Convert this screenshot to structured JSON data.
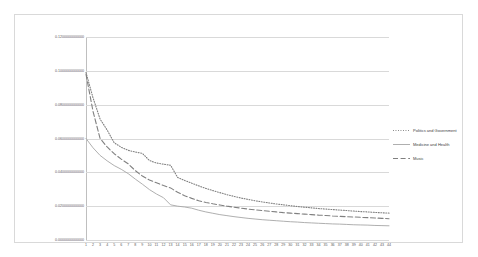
{
  "chart_data": {
    "type": "line",
    "title": "",
    "subtitle": "",
    "xlabel": "",
    "ylabel": "",
    "xlim": [
      1,
      44
    ],
    "ylim": [
      0.0,
      0.12
    ],
    "grid": true,
    "legend_position": "right",
    "y_ticks": [
      "0.0000000000000",
      "0.0200000000000",
      "0.0400000000000",
      "0.0600000000000",
      "0.0800000000000",
      "0.1000000000000",
      "0.1200000000000"
    ],
    "y_tick_values": [
      0.0,
      0.02,
      0.04,
      0.06,
      0.08,
      0.1,
      0.12
    ],
    "categories": [
      "1",
      "2",
      "3",
      "4",
      "5",
      "6",
      "7",
      "8",
      "9",
      "10",
      "11",
      "12",
      "13",
      "14",
      "15",
      "16",
      "17",
      "18",
      "19",
      "20",
      "21",
      "22",
      "23",
      "24",
      "25",
      "26",
      "27",
      "28",
      "29",
      "30",
      "31",
      "32",
      "33",
      "34",
      "35",
      "36",
      "37",
      "38",
      "39",
      "40",
      "41",
      "42",
      "43",
      "44"
    ],
    "series": [
      {
        "name": "Politics and Government",
        "style": "dotted",
        "color": "#808080",
        "values": [
          0.099,
          0.084,
          0.0715,
          0.065,
          0.0575,
          0.0548,
          0.053,
          0.052,
          0.0512,
          0.047,
          0.0455,
          0.0448,
          0.0442,
          0.037,
          0.0352,
          0.0336,
          0.032,
          0.0305,
          0.0292,
          0.028,
          0.0268,
          0.0258,
          0.0248,
          0.024,
          0.0232,
          0.0225,
          0.0219,
          0.0213,
          0.0208,
          0.0203,
          0.0198,
          0.0194,
          0.019,
          0.0186,
          0.0183,
          0.018,
          0.0177,
          0.0174,
          0.0171,
          0.0168,
          0.0166,
          0.0163,
          0.0161,
          0.0159
        ]
      },
      {
        "name": "Medicine and Health",
        "style": "solid",
        "color": "#a6a6a6",
        "values": [
          0.06,
          0.0545,
          0.05,
          0.0468,
          0.044,
          0.0418,
          0.0392,
          0.036,
          0.033,
          0.0298,
          0.0272,
          0.025,
          0.0208,
          0.02,
          0.0195,
          0.0188,
          0.0176,
          0.0166,
          0.0158,
          0.015,
          0.0144,
          0.0138,
          0.0133,
          0.0128,
          0.0124,
          0.012,
          0.0117,
          0.0114,
          0.0111,
          0.0108,
          0.0106,
          0.0103,
          0.0101,
          0.0099,
          0.0097,
          0.0095,
          0.0094,
          0.0092,
          0.009,
          0.0089,
          0.0088,
          0.0086,
          0.0085,
          0.0084
        ]
      },
      {
        "name": "Music",
        "style": "dashed",
        "color": "#808080",
        "values": [
          0.098,
          0.076,
          0.06,
          0.055,
          0.051,
          0.0478,
          0.045,
          0.041,
          0.0378,
          0.0355,
          0.0338,
          0.0322,
          0.0308,
          0.0282,
          0.0262,
          0.0246,
          0.0232,
          0.0222,
          0.0214,
          0.0207,
          0.02,
          0.0194,
          0.0188,
          0.0183,
          0.0178,
          0.0174,
          0.017,
          0.0166,
          0.0162,
          0.0159,
          0.0156,
          0.0153,
          0.015,
          0.0147,
          0.0145,
          0.0142,
          0.014,
          0.0138,
          0.0136,
          0.0134,
          0.0132,
          0.013,
          0.0128,
          0.0126
        ]
      }
    ]
  },
  "legend": {
    "items": [
      {
        "label": "Politics and Government"
      },
      {
        "label": "Medicine and Health"
      },
      {
        "label": "Music"
      }
    ]
  }
}
